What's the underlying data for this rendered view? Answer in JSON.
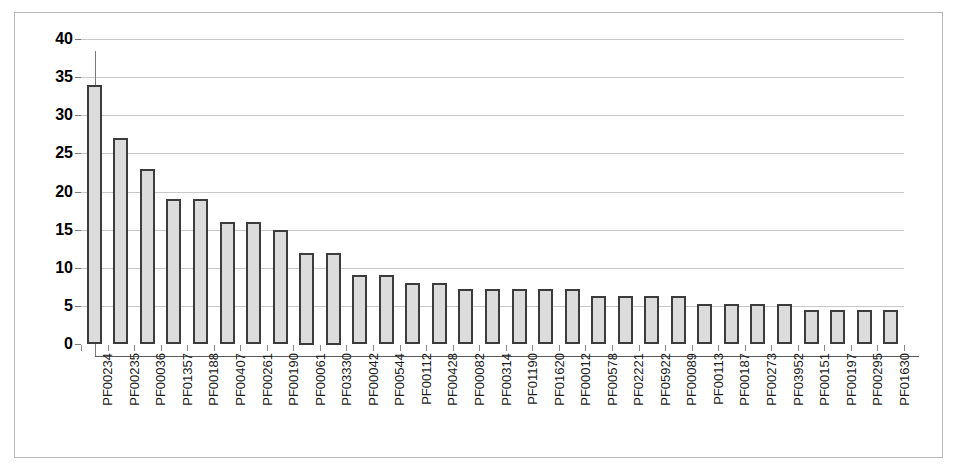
{
  "chart_data": {
    "type": "bar",
    "title": "",
    "subtitle": "",
    "xlabel": "",
    "ylabel": "",
    "ylim": [
      0,
      40
    ],
    "ytick_step": 5,
    "yticks": [
      "0",
      "5",
      "10",
      "15",
      "20",
      "25",
      "30",
      "35",
      "40"
    ],
    "grid": "horizontal",
    "legend": "none",
    "bar_fill_color": "#dcdcdc",
    "bar_border_color": "#3c3c3c",
    "gridline_color": "#c8c8c8",
    "axis_color": "#5a5a5a",
    "background_color": "#ffffff",
    "frame_color": "#b9b9b9",
    "categories": [
      "PF00234",
      "PF00235",
      "PF00036",
      "PF01357",
      "PF00188",
      "PF00407",
      "PF00261",
      "PF00190",
      "PF00061",
      "PF03330",
      "PF00042",
      "PF00544",
      "PF00112",
      "PF00428",
      "PF00082",
      "PF00314",
      "PF01190",
      "PF01620",
      "PF00012",
      "PF00578",
      "PF02221",
      "PF05922",
      "PF00089",
      "PF00113",
      "PF00187",
      "PF00273",
      "PF03952",
      "PF00151",
      "PF00197",
      "PF00295",
      "PF01630"
    ],
    "values": [
      34,
      27,
      23,
      19,
      19,
      16,
      16,
      15,
      12,
      12,
      9,
      9,
      8,
      8,
      7.2,
      7.2,
      7.2,
      7.2,
      7.2,
      6.3,
      6.3,
      6.3,
      6.3,
      5.3,
      5.3,
      5.3,
      5.3,
      4.5,
      4.5,
      4.5,
      4.5
    ]
  }
}
